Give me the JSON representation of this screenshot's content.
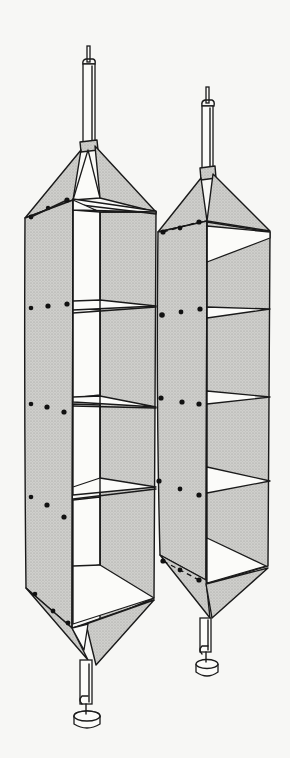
{
  "figure": {
    "colors": {
      "ink": "#1a1a1a",
      "fabric": "#c9c9c6",
      "background": "#f7f7f5"
    },
    "units": [
      {
        "name": "left-organizer",
        "shelves": 5,
        "compartments": 4
      },
      {
        "name": "right-organizer",
        "shelves": 4,
        "compartments": 3
      }
    ]
  }
}
